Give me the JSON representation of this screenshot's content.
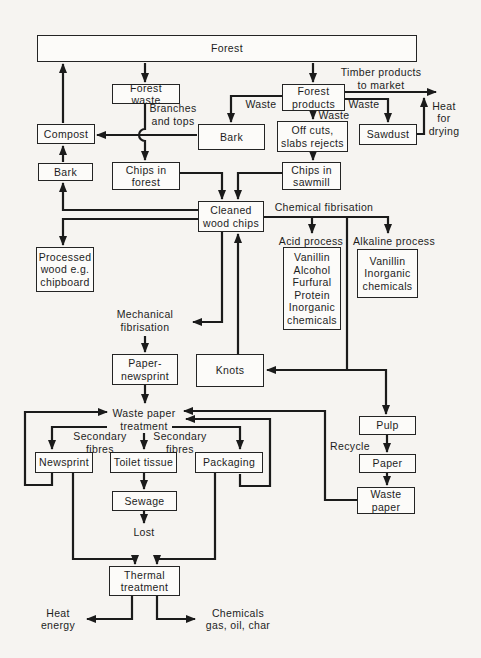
{
  "colors": {
    "background": "#f6f4f1",
    "line": "#1b1b1b",
    "box_border": "#242424",
    "box_fill": "#fcfbf9",
    "text": "#1d1d1d"
  },
  "nodes": [
    {
      "id": "forest",
      "label": "Forest",
      "boxed": true,
      "x": 37,
      "y": 35,
      "w": 380,
      "h": 27
    },
    {
      "id": "forest-waste",
      "label": "Forest waste",
      "boxed": true,
      "x": 112,
      "y": 84,
      "w": 68,
      "h": 20
    },
    {
      "id": "compost",
      "label": "Compost",
      "boxed": true,
      "x": 37,
      "y": 124,
      "w": 58,
      "h": 20
    },
    {
      "id": "bark-upper",
      "label": "Bark",
      "boxed": true,
      "x": 198,
      "y": 124,
      "w": 67,
      "h": 26
    },
    {
      "id": "forest-products",
      "label": "Forest\nproducts",
      "boxed": true,
      "x": 282,
      "y": 84,
      "w": 63,
      "h": 27
    },
    {
      "id": "off-cuts",
      "label": "Off cuts,\nslabs rejects",
      "boxed": true,
      "x": 277,
      "y": 121,
      "w": 71,
      "h": 31
    },
    {
      "id": "sawdust",
      "label": "Sawdust",
      "boxed": true,
      "x": 359,
      "y": 124,
      "w": 58,
      "h": 21
    },
    {
      "id": "bark-lower",
      "label": "Bark",
      "boxed": true,
      "x": 38,
      "y": 163,
      "w": 55,
      "h": 18
    },
    {
      "id": "chips-in-forest",
      "label": "Chips in\nforest",
      "boxed": true,
      "x": 112,
      "y": 162,
      "w": 68,
      "h": 28
    },
    {
      "id": "chips-in-sawmill",
      "label": "Chips in\nsawmill",
      "boxed": true,
      "x": 282,
      "y": 162,
      "w": 59,
      "h": 28
    },
    {
      "id": "cleaned-wood-chips",
      "label": "Cleaned\nwood chips",
      "boxed": true,
      "x": 198,
      "y": 201,
      "w": 66,
      "h": 31
    },
    {
      "id": "processed-wood",
      "label": "Processed\nwood e.g.\nchipboard",
      "boxed": true,
      "x": 36,
      "y": 247,
      "w": 58,
      "h": 45
    },
    {
      "id": "acid-products",
      "label": "Vanillin\nAlcohol\nFurfural\nProtein\nInorganic\nchemicals",
      "boxed": true,
      "x": 283,
      "y": 247,
      "w": 58,
      "h": 83
    },
    {
      "id": "alkaline-products",
      "label": "Vanillin\nInorganic\nchemicals",
      "boxed": true,
      "x": 357,
      "y": 249,
      "w": 61,
      "h": 49
    },
    {
      "id": "paper-newsprint",
      "label": "Paper-\nnewsprint",
      "boxed": true,
      "x": 112,
      "y": 354,
      "w": 66,
      "h": 31
    },
    {
      "id": "knots",
      "label": "Knots",
      "boxed": true,
      "x": 196,
      "y": 354,
      "w": 68,
      "h": 33
    },
    {
      "id": "pulp",
      "label": "Pulp",
      "boxed": true,
      "x": 359,
      "y": 416,
      "w": 57,
      "h": 19
    },
    {
      "id": "newsprint",
      "label": "Newsprint",
      "boxed": true,
      "x": 35,
      "y": 452,
      "w": 58,
      "h": 21
    },
    {
      "id": "toilet-tissue",
      "label": "Toilet tissue",
      "boxed": true,
      "x": 110,
      "y": 452,
      "w": 67,
      "h": 21
    },
    {
      "id": "packaging",
      "label": "Packaging",
      "boxed": true,
      "x": 195,
      "y": 452,
      "w": 68,
      "h": 21
    },
    {
      "id": "paper",
      "label": "Paper",
      "boxed": true,
      "x": 359,
      "y": 454,
      "w": 57,
      "h": 19
    },
    {
      "id": "sewage",
      "label": "Sewage",
      "boxed": true,
      "x": 112,
      "y": 491,
      "w": 65,
      "h": 20
    },
    {
      "id": "waste-paper-box",
      "label": "Waste\npaper",
      "boxed": true,
      "x": 357,
      "y": 487,
      "w": 58,
      "h": 27
    },
    {
      "id": "thermal-treatment",
      "label": "Thermal\ntreatment",
      "boxed": true,
      "x": 109,
      "y": 566,
      "w": 71,
      "h": 30
    },
    {
      "id": "timber-to-market",
      "label": "Timber products\nto market",
      "boxed": false,
      "x": 333,
      "y": 66,
      "w": 96,
      "h": 25
    },
    {
      "id": "waste-left",
      "label": "Waste",
      "boxed": false,
      "x": 239,
      "y": 98,
      "w": 44,
      "h": 13
    },
    {
      "id": "waste-mid",
      "label": "Waste",
      "boxed": false,
      "x": 312,
      "y": 109,
      "w": 44,
      "h": 13
    },
    {
      "id": "waste-right",
      "label": "Waste",
      "boxed": false,
      "x": 342,
      "y": 98,
      "w": 44,
      "h": 13
    },
    {
      "id": "heat-for-drying",
      "label": "Heat\nfor\ndrying",
      "boxed": false,
      "x": 423,
      "y": 99,
      "w": 42,
      "h": 39
    },
    {
      "id": "branches-and-tops",
      "label": "Branches\nand tops",
      "boxed": false,
      "x": 145,
      "y": 102,
      "w": 56,
      "h": 25
    },
    {
      "id": "chemical-fibrisation",
      "label": "Chemical fibrisation",
      "boxed": false,
      "x": 266,
      "y": 201,
      "w": 116,
      "h": 13
    },
    {
      "id": "acid-process",
      "label": "Acid process",
      "boxed": false,
      "x": 275,
      "y": 235,
      "w": 72,
      "h": 13
    },
    {
      "id": "alkaline-process",
      "label": "Alkaline process",
      "boxed": false,
      "x": 349,
      "y": 235,
      "w": 90,
      "h": 13
    },
    {
      "id": "mechanical-fibrisation",
      "label": "Mechanical\nfibrisation",
      "boxed": false,
      "x": 112,
      "y": 308,
      "w": 66,
      "h": 25
    },
    {
      "id": "waste-paper-treatment",
      "label": "Waste paper\ntreatment",
      "boxed": false,
      "x": 108,
      "y": 406,
      "w": 72,
      "h": 27
    },
    {
      "id": "secondary-fibres-left",
      "label": "Secondary\nfibres",
      "boxed": false,
      "x": 70,
      "y": 430,
      "w": 60,
      "h": 25
    },
    {
      "id": "secondary-fibres-right",
      "label": "Secondary\nfibres",
      "boxed": false,
      "x": 150,
      "y": 430,
      "w": 60,
      "h": 25
    },
    {
      "id": "recycle",
      "label": "Recycle",
      "boxed": false,
      "x": 325,
      "y": 440,
      "w": 50,
      "h": 13
    },
    {
      "id": "lost",
      "label": "Lost",
      "boxed": false,
      "x": 126,
      "y": 525,
      "w": 36,
      "h": 14
    },
    {
      "id": "heat-energy",
      "label": "Heat\nenergy",
      "boxed": false,
      "x": 36,
      "y": 606,
      "w": 44,
      "h": 26
    },
    {
      "id": "chemicals-out",
      "label": "Chemicals\ngas, oil, char",
      "boxed": false,
      "x": 196,
      "y": 606,
      "w": 84,
      "h": 26
    }
  ]
}
